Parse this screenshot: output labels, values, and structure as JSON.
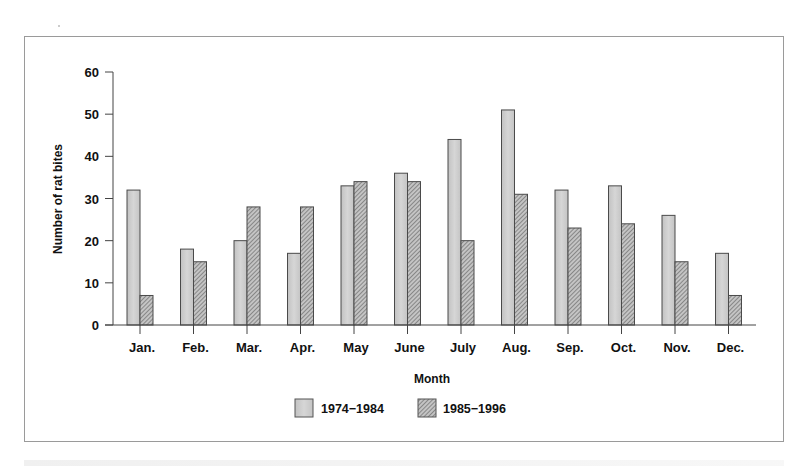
{
  "chart_data": {
    "type": "bar",
    "title": "",
    "xlabel": "Month",
    "ylabel": "Number of rat bites",
    "ylim": [
      0,
      60
    ],
    "yticks": [
      0,
      10,
      20,
      30,
      40,
      50,
      60
    ],
    "grid": false,
    "legend_position": "bottom-center",
    "categories": [
      "Jan.",
      "Feb.",
      "Mar.",
      "Apr.",
      "May",
      "June",
      "July",
      "Aug.",
      "Sep.",
      "Oct.",
      "Nov.",
      "Dec."
    ],
    "series": [
      {
        "name": "1974−1984",
        "pattern": "solid-light-gray",
        "color": "#c8c8c8",
        "values": [
          32,
          18,
          20,
          17,
          33,
          36,
          44,
          51,
          32,
          33,
          26,
          17
        ]
      },
      {
        "name": "1985−1996",
        "pattern": "diagonal-hatch",
        "color": "#9a9a9a",
        "values": [
          7,
          15,
          28,
          28,
          34,
          34,
          20,
          31,
          23,
          24,
          15,
          7
        ]
      }
    ]
  },
  "labels": {
    "xlabel": "Month",
    "ylabel": "Number of rat bites",
    "legend": [
      "1974−1984",
      "1985−1996"
    ]
  }
}
